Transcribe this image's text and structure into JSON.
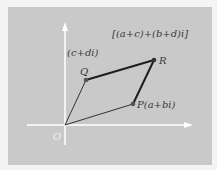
{
  "diagram": {
    "background_color": "#c9c9c9",
    "axis_color": "#ffffff",
    "line_color": "#2a2a2a",
    "point_color": "#5a5a5a",
    "labels": {
      "origin": "O",
      "point_q": "Q",
      "point_q_value": "(c+di)",
      "point_p": "P(a+bi)",
      "point_r": "R",
      "sum_expression": "[(a+c)+(b+d)i]"
    },
    "points": {
      "O": [
        65,
        125
      ],
      "P": [
        133,
        104
      ],
      "Q": [
        86,
        80
      ],
      "R": [
        154,
        60
      ]
    }
  }
}
